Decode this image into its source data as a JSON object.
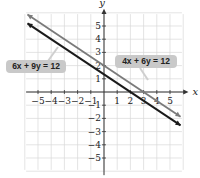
{
  "chart_data": {
    "type": "line",
    "title": "",
    "xlabel": "x",
    "ylabel": "y",
    "xlim": [
      -5.9,
      5.9
    ],
    "ylim": [
      -5.9,
      5.9
    ],
    "grid": true,
    "x_ticks": [
      -5,
      -4,
      -3,
      -2,
      -1,
      1,
      2,
      3,
      4,
      5
    ],
    "y_ticks": [
      -5,
      -4,
      -3,
      -2,
      -1,
      1,
      2,
      3,
      4,
      5
    ],
    "series": [
      {
        "name": "4x + 6y = 12",
        "color": "#7a7a7a",
        "slope": -0.6667,
        "intercept": 2,
        "points": [
          [
            -5.8,
            5.867
          ],
          [
            5.8,
            -1.867
          ]
        ],
        "x_intercept": 3,
        "y_intercept": 2
      },
      {
        "name": "6x + 9y = 12",
        "color": "#1a1a1a",
        "slope": -0.6667,
        "intercept": 1.333,
        "points": [
          [
            -5.8,
            5.2
          ],
          [
            5.8,
            -2.533
          ]
        ],
        "x_intercept": 2,
        "y_intercept": 1.333
      }
    ],
    "annotations": [
      {
        "text": "6x + 9y = 12",
        "position": "left"
      },
      {
        "text": "4x + 6y = 12",
        "position": "right"
      }
    ]
  },
  "labels": {
    "left_pill": "6x + 9y = 12",
    "right_pill": "4x + 6y = 12",
    "x_axis": "x",
    "y_axis": "y"
  }
}
